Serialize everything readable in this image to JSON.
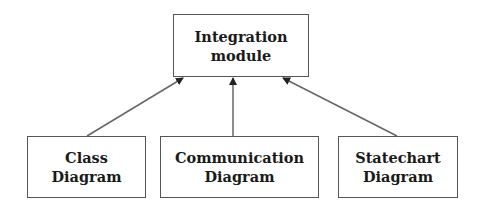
{
  "diagram": {
    "nodes": [
      {
        "id": "integration",
        "label": "Integration\nmodule",
        "x": 173,
        "y": 14,
        "w": 136,
        "h": 63
      },
      {
        "id": "class",
        "label": "Class\nDiagram",
        "x": 27,
        "y": 136,
        "w": 119,
        "h": 62
      },
      {
        "id": "communication",
        "label": "Communication\nDiagram",
        "x": 160,
        "y": 136,
        "w": 159,
        "h": 62
      },
      {
        "id": "statechart",
        "label": "Statechart\nDiagram",
        "x": 338,
        "y": 136,
        "w": 120,
        "h": 62
      }
    ],
    "edges": [
      {
        "from": "class",
        "to": "integration",
        "type": "directed-arrow"
      },
      {
        "from": "communication",
        "to": "integration",
        "type": "directed-arrow"
      },
      {
        "from": "statechart",
        "to": "integration",
        "type": "directed-arrow"
      }
    ],
    "colors": {
      "stroke": "#555555",
      "text": "#1a1a1a",
      "background": "#ffffff"
    }
  }
}
